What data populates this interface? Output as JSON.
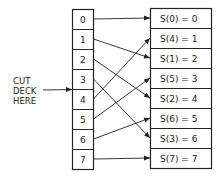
{
  "diagram": {
    "label": [
      "CUT",
      "DECK",
      "HERE"
    ],
    "left_cells": [
      "0",
      "1",
      "2",
      "3",
      "4",
      "5",
      "6",
      "7"
    ],
    "right_cells": [
      "S(0) = 0",
      "S(4) = 1",
      "S(1) = 2",
      "S(5) = 3",
      "S(2) = 4",
      "S(6) = 5",
      "S(3) = 6",
      "S(7) = 7"
    ],
    "mapping": [
      {
        "from": 0,
        "to": 0
      },
      {
        "from": 1,
        "to": 2
      },
      {
        "from": 2,
        "to": 4
      },
      {
        "from": 3,
        "to": 6
      },
      {
        "from": 4,
        "to": 1
      },
      {
        "from": 5,
        "to": 3
      },
      {
        "from": 6,
        "to": 5
      },
      {
        "from": 7,
        "to": 7
      }
    ],
    "colors": {
      "line": "#222222",
      "background": "#ffffff"
    }
  }
}
